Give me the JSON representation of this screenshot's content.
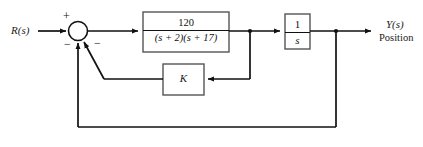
{
  "diagram": {
    "type": "control-system-block-diagram",
    "input": {
      "label": "R(s)"
    },
    "output": {
      "label": "Y(s)",
      "sublabel": "Position"
    },
    "summing_junction": {
      "signs": {
        "input": "+",
        "outer_feedback": "−",
        "inner_feedback": "−"
      }
    },
    "blocks": [
      {
        "name": "plant",
        "numerator": "120",
        "denominator_open": "(",
        "denominator": "(s + 2)(s + 17)",
        "den_part1_var": "s",
        "den_part1_op": " + ",
        "den_part1_num": "2",
        "den_part2_var": "s",
        "den_part2_op": " + ",
        "den_part2_num": "17"
      },
      {
        "name": "integrator",
        "numerator": "1",
        "denominator": "s"
      },
      {
        "name": "gain",
        "label": "K"
      }
    ],
    "colors": {
      "line": "#111111",
      "block_border": "#555555",
      "background": "#ffffff"
    }
  }
}
